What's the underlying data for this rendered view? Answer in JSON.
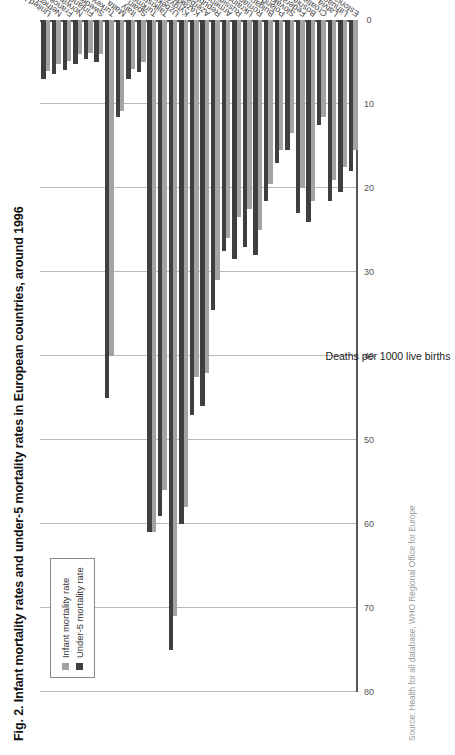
{
  "chart_data": {
    "type": "bar",
    "orientation": "vertical-bars-rotated",
    "title": "Fig. 2. Infant mortality rates and under-5 mortality rates in European countries, around 1996",
    "xlabel": "",
    "ylabel": "Deaths per 1000 live births",
    "ylim": [
      0,
      80
    ],
    "ytick_labels": [
      "0",
      "10",
      "20",
      "30",
      "40",
      "50",
      "60",
      "70",
      "80"
    ],
    "ytick_values": [
      0,
      10,
      20,
      30,
      40,
      50,
      60,
      70,
      80
    ],
    "grid": true,
    "legend_position": "top-left",
    "categories": [
      "United Kingdom",
      "Netherlands",
      "France",
      "Norway",
      "Finland",
      "Sweden",
      "Turkey",
      "Malta",
      "Italy",
      "Spain",
      "Turkmenistan",
      "Tajikistan",
      "Uzbekistan",
      "Kyrgyzstan",
      "Kazakhstan",
      "Azerbaijan",
      "Republic of Moldova",
      "Armenia",
      "Russian Federation",
      "Ukraine",
      "Romania",
      "Bulgaria",
      "Poland",
      "Slovakia",
      "Federal Republic of Yugoslavia",
      "Bosnia and Herzegovina",
      "Croatia",
      "Latvia",
      "Lithuania",
      "Estonia"
    ],
    "series": [
      {
        "name": "Infant mortality rate",
        "color": "#a3a3a3",
        "values": [
          6.1,
          5.2,
          4.9,
          4.1,
          3.9,
          4.0,
          40.0,
          10.8,
          5.8,
          5.0,
          61.0,
          56.0,
          71.0,
          58.0,
          42.5,
          42.0,
          31.0,
          26.0,
          23.5,
          22.5,
          25.0,
          19.5,
          15.5,
          13.5,
          20.0,
          21.5,
          11.5,
          19.0,
          17.5,
          15.5
        ]
      },
      {
        "name": "Under-5 mortality rate",
        "color": "#3f3f3f",
        "values": [
          7.0,
          6.4,
          5.9,
          5.2,
          4.7,
          5.0,
          45.0,
          11.5,
          7.0,
          6.2,
          61.0,
          59.0,
          75.0,
          60.0,
          47.0,
          46.0,
          34.5,
          27.5,
          28.5,
          27.0,
          28.0,
          21.5,
          17.0,
          15.5,
          23.0,
          24.0,
          12.5,
          21.5,
          20.5,
          18.0
        ]
      }
    ]
  },
  "legend": {
    "items": [
      {
        "label": "Infant mortality rate",
        "color": "#a3a3a3"
      },
      {
        "label": "Under-5 mortality rate",
        "color": "#3f3f3f"
      }
    ]
  },
  "source": {
    "text": "Source: Health for all database, WHO Regional Office for Europe"
  }
}
